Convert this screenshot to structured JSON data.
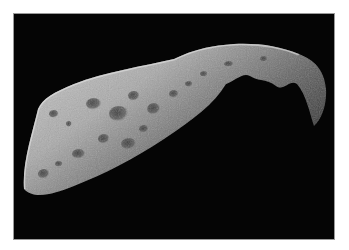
{
  "image": {
    "subject": "Asteroid in space",
    "description": "Grayscale photograph of an elongated, heavily cratered asteroid against a black background, shown with a thin light border",
    "colors": {
      "background": "#ffffff",
      "space": "#050505",
      "border": "#9a9a9a",
      "surface_light": "#c8c8c8",
      "surface_mid": "#8a8a8a",
      "surface_dark": "#2a2a2a"
    }
  }
}
